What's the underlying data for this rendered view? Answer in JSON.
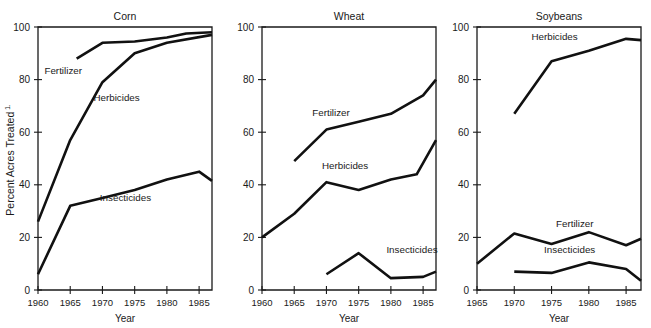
{
  "figure": {
    "ylabel": "Percent Acres Treated",
    "ylabel_superscript": "1.",
    "xlabel": "Year",
    "line_color": "#111111",
    "axis_color": "#1a1a1a",
    "background": "#ffffff"
  },
  "chart_data": [
    {
      "type": "line",
      "title": "Corn",
      "xlabel": "Year",
      "ylabel": "Percent Acres Treated",
      "xlim": [
        1960,
        1987
      ],
      "ylim": [
        0,
        100
      ],
      "xticks": [
        1960,
        1965,
        1970,
        1975,
        1980,
        1985
      ],
      "xtick_labels": [
        "1960",
        "1965",
        "1970",
        "1975",
        "1980",
        "1985"
      ],
      "yticks": [
        0,
        20,
        40,
        60,
        80,
        100
      ],
      "ytick_labels": [
        "0",
        "20",
        "40",
        "60",
        "80",
        "100"
      ],
      "grid": false,
      "legend": "inline-annotations",
      "series": [
        {
          "name": "Fertilizer",
          "label_x": 1961.0,
          "label_y": 82,
          "x": [
            1966,
            1970,
            1975,
            1980,
            1983,
            1987
          ],
          "values": [
            88,
            94,
            94.5,
            96,
            97.5,
            98
          ]
        },
        {
          "name": "Herbicides",
          "label_x": 1968.6,
          "label_y": 72,
          "x": [
            1960,
            1965,
            1970,
            1975,
            1980,
            1987
          ],
          "values": [
            26,
            57,
            79,
            90,
            94,
            97
          ]
        },
        {
          "name": "Insecticides",
          "label_x": 1969.6,
          "label_y": 34,
          "x": [
            1960,
            1965,
            1970,
            1975,
            1980,
            1985,
            1987
          ],
          "values": [
            6,
            32,
            35,
            38,
            42,
            45,
            41.5
          ]
        }
      ]
    },
    {
      "type": "line",
      "title": "Wheat",
      "xlabel": "Year",
      "ylabel": "Percent Acres Treated",
      "xlim": [
        1960,
        1987
      ],
      "ylim": [
        0,
        100
      ],
      "xticks": [
        1960,
        1965,
        1970,
        1975,
        1980,
        1985
      ],
      "xtick_labels": [
        "1960",
        "1965",
        "1970",
        "1975",
        "1980",
        "1985"
      ],
      "yticks": [
        0,
        20,
        40,
        60,
        80,
        100
      ],
      "ytick_labels": [
        "0",
        "20",
        "40",
        "60",
        "80",
        "100"
      ],
      "grid": false,
      "legend": "inline-annotations",
      "series": [
        {
          "name": "Fertilizer",
          "label_x": 1967.8,
          "label_y": 66,
          "x": [
            1965,
            1970,
            1975,
            1980,
            1985,
            1987
          ],
          "values": [
            49,
            61,
            64,
            67,
            74,
            80
          ]
        },
        {
          "name": "Herbicides",
          "label_x": 1969.3,
          "label_y": 46,
          "x": [
            1960,
            1965,
            1970,
            1975,
            1980,
            1984,
            1987
          ],
          "values": [
            20,
            29,
            41,
            38,
            42,
            44,
            57
          ]
        },
        {
          "name": "Insecticides",
          "label_x": 1979.3,
          "label_y": 14,
          "x": [
            1970,
            1975,
            1980,
            1985,
            1987
          ],
          "values": [
            6,
            14,
            4.5,
            5,
            7
          ]
        }
      ]
    },
    {
      "type": "line",
      "title": "Soybeans",
      "xlabel": "Year",
      "ylabel": "Percent Acres Treated",
      "xlim": [
        1965,
        1987
      ],
      "ylim": [
        0,
        100
      ],
      "xticks": [
        1965,
        1970,
        1975,
        1980,
        1985
      ],
      "xtick_labels": [
        "1965",
        "1970",
        "1975",
        "1980",
        "1985"
      ],
      "yticks": [
        0,
        20,
        40,
        60,
        80,
        100
      ],
      "ytick_labels": [
        "0",
        "20",
        "40",
        "60",
        "80",
        "100"
      ],
      "grid": false,
      "legend": "inline-annotations",
      "series": [
        {
          "name": "Herbicides",
          "label_x": 1972.3,
          "label_y": 95,
          "x": [
            1970,
            1975,
            1980,
            1985,
            1987
          ],
          "values": [
            67,
            87,
            91,
            95.5,
            95
          ]
        },
        {
          "name": "Fertilizer",
          "label_x": 1975.6,
          "label_y": 24,
          "x": [
            1965,
            1970,
            1975,
            1980,
            1985,
            1987
          ],
          "values": [
            10,
            21.5,
            17.5,
            22,
            17,
            19.5
          ]
        },
        {
          "name": "Insecticides",
          "label_x": 1974.0,
          "label_y": 14,
          "x": [
            1970,
            1975,
            1980,
            1985,
            1987
          ],
          "values": [
            7,
            6.5,
            10.5,
            8,
            3.5
          ]
        }
      ]
    }
  ]
}
